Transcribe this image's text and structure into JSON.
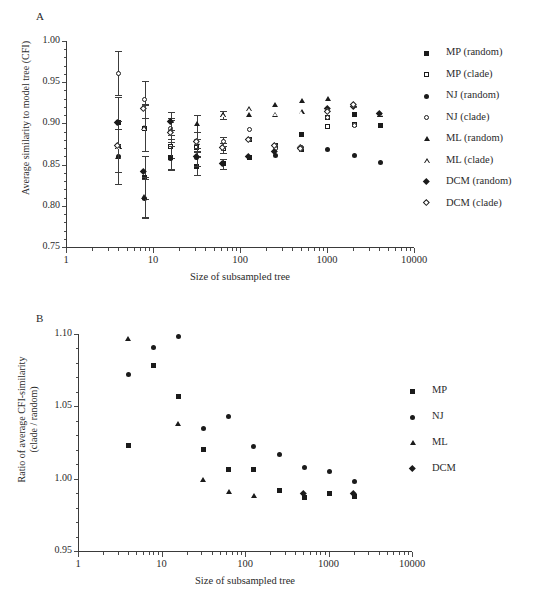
{
  "figure": {
    "panel_a_letter": "A",
    "panel_b_letter": "B"
  },
  "chart_data": [
    {
      "panel": "A",
      "type": "scatter",
      "title": "",
      "xlabel": "Size of subsampled tree",
      "ylabel": "Average similarity to model tree (CFI)",
      "xscale": "log",
      "xlim": [
        1,
        10000
      ],
      "ylim": [
        0.75,
        1.0
      ],
      "xticks": [
        1,
        10,
        100,
        1000,
        10000
      ],
      "xticklabels": [
        "1",
        "10",
        "100",
        "1000",
        "10000"
      ],
      "yticks": [
        0.75,
        0.8,
        0.85,
        0.9,
        0.95,
        1.0
      ],
      "yticklabels": [
        "0.75",
        "0.80",
        "0.85",
        "0.90",
        "0.95",
        "1.00"
      ],
      "grid": false,
      "legend_position": "right",
      "legend": [
        {
          "label": "MP (random)",
          "marker": "square-filled"
        },
        {
          "label": "MP (clade)",
          "marker": "square-open"
        },
        {
          "label": "NJ (random)",
          "marker": "circle-filled"
        },
        {
          "label": "NJ (clade)",
          "marker": "circle-open"
        },
        {
          "label": "ML (random)",
          "marker": "triangle-filled"
        },
        {
          "label": "ML (clade)",
          "marker": "triangle-open"
        },
        {
          "label": "DCM (random)",
          "marker": "diamond-filled"
        },
        {
          "label": "DCM (clade)",
          "marker": "diamond-open"
        }
      ],
      "x": [
        4,
        8,
        16,
        32,
        64,
        128,
        256,
        512,
        1024,
        2048,
        4096
      ],
      "series": [
        {
          "name": "MP (random)",
          "marker": "square-filled",
          "values": [
            0.901,
            0.834,
            0.859,
            0.848,
            0.851,
            0.859,
            0.872,
            0.886,
            0.907,
            0.911,
            0.897
          ],
          "errors": [
            0.031,
            0.026,
            0.014,
            0.011,
            0.006,
            null,
            null,
            null,
            null,
            null,
            null
          ]
        },
        {
          "name": "MP (clade)",
          "marker": "square-open",
          "values": [
            0.872,
            0.894,
            0.872,
            0.871,
            0.87,
            0.88,
            0.873,
            0.868,
            0.896,
            0.899,
            null
          ],
          "errors": [
            0.031,
            0.028,
            0.014,
            0.01,
            0.006,
            null,
            null,
            null,
            null,
            null,
            null
          ]
        },
        {
          "name": "NJ (random)",
          "marker": "circle-filled",
          "values": [
            0.86,
            0.809,
            0.858,
            0.859,
            0.851,
            0.859,
            0.861,
            0.868,
            0.868,
            0.861,
            0.853
          ],
          "errors": [
            0.033,
            0.024,
            0.014,
            0.011,
            0.006,
            null,
            null,
            null,
            null,
            null,
            null
          ]
        },
        {
          "name": "NJ (clade)",
          "marker": "circle-open",
          "values": [
            0.961,
            0.929,
            0.894,
            0.878,
            0.878,
            0.892,
            0.869,
            0.871,
            0.907,
            0.898,
            null
          ],
          "errors": [
            0.027,
            0.023,
            0.013,
            0.012,
            0.006,
            null,
            null,
            null,
            null,
            null,
            null
          ]
        },
        {
          "name": "ML (random)",
          "marker": "triangle-filled",
          "values": [
            0.86,
            0.811,
            0.903,
            0.9,
            0.91,
            0.911,
            0.922,
            0.927,
            0.93,
            0.922,
            0.911
          ],
          "errors": [
            0.033,
            0.024,
            0.011,
            0.01,
            0.005,
            null,
            null,
            null,
            null,
            null,
            null
          ]
        },
        {
          "name": "ML (clade)",
          "marker": "triangle-open",
          "values": [
            0.872,
            0.895,
            0.891,
            0.877,
            0.91,
            0.918,
            0.911,
            0.914,
            0.917,
            0.921,
            0.911
          ],
          "errors": [
            0.031,
            0.028,
            0.013,
            0.012,
            0.005,
            null,
            null,
            null,
            null,
            null,
            null
          ]
        },
        {
          "name": "DCM (random)",
          "marker": "diamond-filled",
          "values": [
            0.9,
            0.841,
            0.901,
            0.859,
            0.851,
            0.859,
            0.865,
            0.87,
            0.917,
            0.92,
            0.911
          ],
          "errors": [
            null,
            null,
            null,
            null,
            null,
            null,
            null,
            null,
            null,
            null,
            null
          ]
        },
        {
          "name": "DCM (clade)",
          "marker": "diamond-open",
          "values": [
            0.872,
            0.917,
            0.888,
            0.877,
            0.87,
            0.88,
            0.872,
            0.869,
            0.913,
            0.922,
            null
          ],
          "errors": [
            null,
            null,
            null,
            null,
            null,
            null,
            null,
            null,
            null,
            null,
            null
          ]
        }
      ]
    },
    {
      "panel": "B",
      "type": "scatter",
      "title": "",
      "xlabel": "Size of subsampled tree",
      "ylabel": "Ratio of average CFI-similarity (clade / random)",
      "ylabel_line1": "Ratio of average CFI-similarity",
      "ylabel_line2": "(clade / random)",
      "xscale": "log",
      "xlim": [
        1,
        10000
      ],
      "ylim": [
        0.95,
        1.1
      ],
      "xticks": [
        1,
        10,
        100,
        1000,
        10000
      ],
      "xticklabels": [
        "1",
        "10",
        "100",
        "1000",
        "10000"
      ],
      "yticks": [
        0.95,
        1.0,
        1.05,
        1.1
      ],
      "yticklabels": [
        "0.95",
        "1.00",
        "1.05",
        "1.10"
      ],
      "grid": false,
      "legend_position": "right",
      "legend": [
        {
          "label": "MP",
          "marker": "square-filled"
        },
        {
          "label": "NJ",
          "marker": "circle-filled"
        },
        {
          "label": "ML",
          "marker": "triangle-filled"
        },
        {
          "label": "DCM",
          "marker": "diamond-filled"
        }
      ],
      "x": [
        4,
        8,
        16,
        32,
        64,
        128,
        256,
        512,
        1024,
        2048
      ],
      "series": [
        {
          "name": "MP",
          "marker": "square-filled",
          "values": [
            1.023,
            1.078,
            1.057,
            1.02,
            1.006,
            1.006,
            0.992,
            0.987,
            0.99,
            0.988
          ]
        },
        {
          "name": "NJ",
          "marker": "circle-filled",
          "values": [
            1.072,
            1.091,
            1.098,
            1.035,
            1.043,
            1.022,
            1.017,
            1.008,
            1.005,
            0.998
          ]
        },
        {
          "name": "ML",
          "marker": "triangle-filled",
          "values": [
            1.097,
            null,
            1.038,
            0.999,
            0.991,
            0.988,
            null,
            null,
            null,
            null
          ]
        },
        {
          "name": "DCM",
          "marker": "diamond-filled",
          "values": [
            null,
            null,
            null,
            null,
            null,
            null,
            null,
            0.989,
            null,
            0.989
          ]
        }
      ]
    }
  ]
}
